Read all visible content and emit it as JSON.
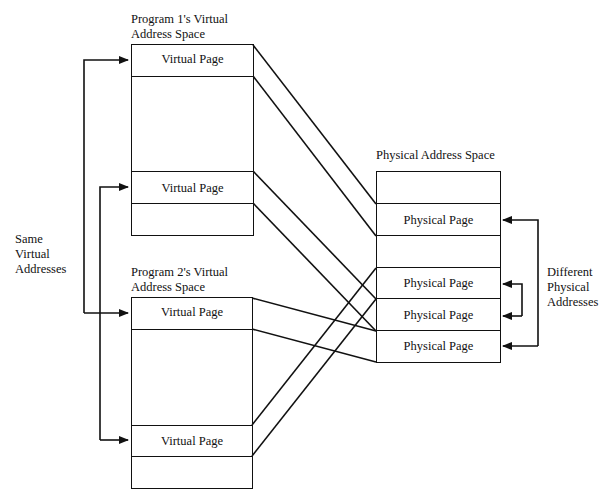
{
  "diagram": {
    "program1": {
      "title_line1": "Program 1's Virtual",
      "title_line2": "Address Space",
      "pages": [
        {
          "label": "Virtual Page",
          "maps_to_physical_index": 1
        },
        {
          "label": "",
          "maps_to_physical_index": null
        },
        {
          "label": "Virtual Page",
          "maps_to_physical_index": 3
        },
        {
          "label": "",
          "maps_to_physical_index": null
        }
      ]
    },
    "program2": {
      "title_line1": "Program 2's Virtual",
      "title_line2": "Address Space",
      "pages": [
        {
          "label": "Virtual Page",
          "maps_to_physical_index": 5
        },
        {
          "label": "",
          "maps_to_physical_index": null
        },
        {
          "label": "Virtual Page",
          "maps_to_physical_index": 4
        },
        {
          "label": "",
          "maps_to_physical_index": null
        }
      ]
    },
    "physical": {
      "title": "Physical Address Space",
      "pages": [
        {
          "label": ""
        },
        {
          "label": "Physical Page"
        },
        {
          "label": ""
        },
        {
          "label": "Physical Page"
        },
        {
          "label": "Physical Page"
        },
        {
          "label": "Physical Page"
        }
      ]
    },
    "left_annotation": {
      "line1": "Same",
      "line2": "Virtual",
      "line3": "Addresses"
    },
    "right_annotation": {
      "line1": "Different",
      "line2": "Physical",
      "line3": "Addresses"
    },
    "stroke_color": "#111111",
    "background_color": "#ffffff"
  }
}
